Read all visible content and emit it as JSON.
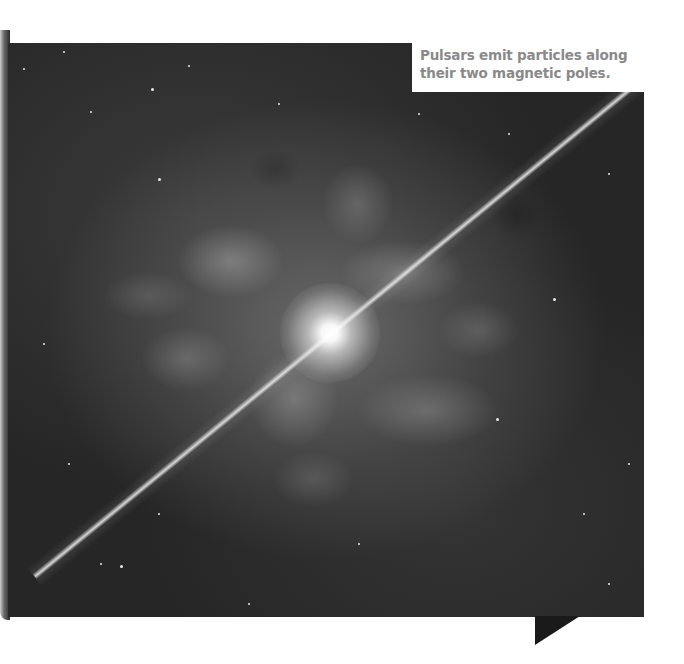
{
  "figure": {
    "caption": {
      "line1": "Pulsars emit particles along",
      "line2": "their two magnetic poles."
    },
    "colors": {
      "caption_text": "#8a8a8a",
      "caption_bg": "#ffffff",
      "space_bg": "#1d1d1d"
    }
  }
}
